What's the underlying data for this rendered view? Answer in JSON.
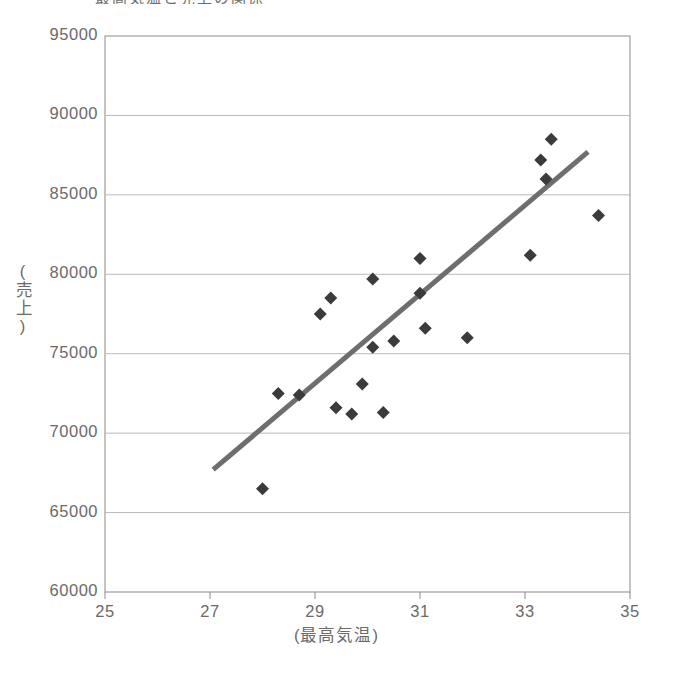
{
  "chart_data": {
    "type": "scatter",
    "title": "最高気温と売上の関係",
    "xlabel": "(最高気温)",
    "ylabel": "(売上)",
    "xlim": [
      25,
      35
    ],
    "ylim": [
      60000,
      95000
    ],
    "xticks": [
      25,
      27,
      29,
      31,
      33,
      35
    ],
    "yticks": [
      60000,
      65000,
      70000,
      75000,
      80000,
      85000,
      90000,
      95000
    ],
    "grid": "horizontal",
    "legend": "none",
    "marker": "diamond",
    "marker_color": "#3b3b3b",
    "trendline": {
      "visible": true,
      "color": "#6e6e6e",
      "width": 5,
      "x_start": 27.06,
      "y_start": 67700,
      "x_end": 34.2,
      "y_end": 87700
    },
    "points": [
      {
        "x": 28.0,
        "y": 66500
      },
      {
        "x": 28.3,
        "y": 72500
      },
      {
        "x": 28.7,
        "y": 72400
      },
      {
        "x": 29.1,
        "y": 77500
      },
      {
        "x": 29.3,
        "y": 78500
      },
      {
        "x": 29.4,
        "y": 71600
      },
      {
        "x": 29.7,
        "y": 71200
      },
      {
        "x": 29.9,
        "y": 73100
      },
      {
        "x": 30.1,
        "y": 75400
      },
      {
        "x": 30.1,
        "y": 79700
      },
      {
        "x": 30.3,
        "y": 71300
      },
      {
        "x": 30.5,
        "y": 75800
      },
      {
        "x": 31.0,
        "y": 78800
      },
      {
        "x": 31.0,
        "y": 81000
      },
      {
        "x": 31.1,
        "y": 76600
      },
      {
        "x": 31.9,
        "y": 76000
      },
      {
        "x": 33.1,
        "y": 81200
      },
      {
        "x": 33.3,
        "y": 87200
      },
      {
        "x": 33.4,
        "y": 86000
      },
      {
        "x": 33.5,
        "y": 88500
      },
      {
        "x": 34.4,
        "y": 83700
      }
    ]
  },
  "axes": {
    "y_labels": [
      "95000",
      "90000",
      "85000",
      "80000",
      "75000",
      "70000",
      "65000",
      "60000"
    ],
    "x_labels": [
      "25",
      "27",
      "29",
      "31",
      "33",
      "35"
    ]
  }
}
